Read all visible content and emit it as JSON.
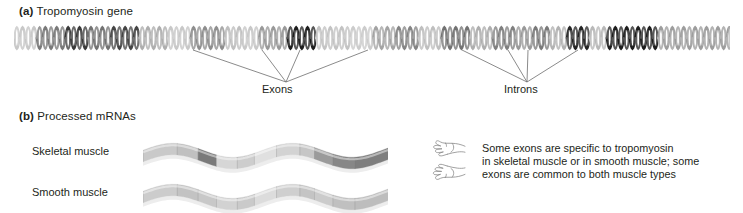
{
  "figure": {
    "panels": [
      {
        "tag": "(a)",
        "title": "Tropomyosin gene"
      },
      {
        "tag": "(b)",
        "title": "Processed mRNAs"
      }
    ]
  },
  "gene": {
    "callouts": [
      {
        "label": "Exons",
        "apex_x": 286,
        "apex_y": 82,
        "leader_x": [
          193,
          262,
          300,
          368
        ]
      },
      {
        "label": "Introns",
        "apex_x": 527,
        "apex_y": 82,
        "leader_x": [
          462,
          508,
          528,
          578
        ]
      }
    ],
    "helix": {
      "x": 14,
      "y": 25,
      "width": 716,
      "height": 26,
      "turn_width": 11.4,
      "strand_colors": [
        "#6f6f6f",
        "#b9b9b9"
      ],
      "segments": [
        {
          "start": 0.0,
          "end": 0.035,
          "shade": 0.18,
          "kind": "intron"
        },
        {
          "start": 0.035,
          "end": 0.075,
          "shade": 0.55,
          "kind": "intron"
        },
        {
          "start": 0.075,
          "end": 0.105,
          "shade": 0.85,
          "kind": "exon"
        },
        {
          "start": 0.105,
          "end": 0.135,
          "shade": 0.58,
          "kind": "intron"
        },
        {
          "start": 0.135,
          "end": 0.175,
          "shade": 0.8,
          "kind": "exon"
        },
        {
          "start": 0.175,
          "end": 0.215,
          "shade": 0.3,
          "kind": "intron"
        },
        {
          "start": 0.215,
          "end": 0.245,
          "shade": 0.18,
          "kind": "intron"
        },
        {
          "start": 0.245,
          "end": 0.295,
          "shade": 0.45,
          "kind": "intron"
        },
        {
          "start": 0.295,
          "end": 0.32,
          "shade": 0.22,
          "kind": "intron"
        },
        {
          "start": 0.32,
          "end": 0.345,
          "shade": 0.18,
          "kind": "intron"
        },
        {
          "start": 0.345,
          "end": 0.385,
          "shade": 0.4,
          "kind": "intron"
        },
        {
          "start": 0.385,
          "end": 0.42,
          "shade": 0.98,
          "kind": "exon"
        },
        {
          "start": 0.42,
          "end": 0.47,
          "shade": 0.2,
          "kind": "intron"
        },
        {
          "start": 0.47,
          "end": 0.5,
          "shade": 0.16,
          "kind": "intron"
        },
        {
          "start": 0.5,
          "end": 0.53,
          "shade": 0.35,
          "kind": "intron"
        },
        {
          "start": 0.53,
          "end": 0.565,
          "shade": 0.5,
          "kind": "intron"
        },
        {
          "start": 0.565,
          "end": 0.6,
          "shade": 0.22,
          "kind": "intron"
        },
        {
          "start": 0.6,
          "end": 0.635,
          "shade": 0.58,
          "kind": "intron"
        },
        {
          "start": 0.635,
          "end": 0.665,
          "shade": 0.3,
          "kind": "intron"
        },
        {
          "start": 0.665,
          "end": 0.7,
          "shade": 0.52,
          "kind": "intron"
        },
        {
          "start": 0.7,
          "end": 0.725,
          "shade": 0.4,
          "kind": "intron"
        },
        {
          "start": 0.725,
          "end": 0.745,
          "shade": 0.55,
          "kind": "intron"
        },
        {
          "start": 0.745,
          "end": 0.775,
          "shade": 0.28,
          "kind": "intron"
        },
        {
          "start": 0.775,
          "end": 0.805,
          "shade": 0.95,
          "kind": "exon"
        },
        {
          "start": 0.805,
          "end": 0.83,
          "shade": 0.25,
          "kind": "intron"
        },
        {
          "start": 0.83,
          "end": 0.9,
          "shade": 0.98,
          "kind": "exon"
        },
        {
          "start": 0.9,
          "end": 1.0,
          "shade": 0.38,
          "kind": "intron"
        }
      ]
    }
  },
  "mrnas": {
    "rows": [
      {
        "label": "Skeletal muscle",
        "name": "skeletal-muscle",
        "width": 245,
        "height": 26,
        "segments": [
          {
            "start": 0.0,
            "end": 0.14,
            "color": "#c9c9c9"
          },
          {
            "start": 0.14,
            "end": 0.225,
            "color": "#c0c0c0"
          },
          {
            "start": 0.225,
            "end": 0.3,
            "color": "#7a7a7a"
          },
          {
            "start": 0.3,
            "end": 0.385,
            "color": "#d6d6d6"
          },
          {
            "start": 0.385,
            "end": 0.455,
            "color": "#cdcdcd"
          },
          {
            "start": 0.455,
            "end": 0.545,
            "color": "#e0e0e0"
          },
          {
            "start": 0.545,
            "end": 0.64,
            "color": "#d3d3d3"
          },
          {
            "start": 0.64,
            "end": 0.7,
            "color": "#c6c6c6"
          },
          {
            "start": 0.7,
            "end": 0.775,
            "color": "#9b9b9b"
          },
          {
            "start": 0.775,
            "end": 0.865,
            "color": "#878787"
          },
          {
            "start": 0.865,
            "end": 1.0,
            "color": "#7e7e7e"
          }
        ]
      },
      {
        "label": "Smooth muscle",
        "name": "smooth-muscle",
        "width": 245,
        "height": 26,
        "segments": [
          {
            "start": 0.0,
            "end": 0.14,
            "color": "#cccccc"
          },
          {
            "start": 0.14,
            "end": 0.225,
            "color": "#c3c3c3"
          },
          {
            "start": 0.225,
            "end": 0.3,
            "color": "#c8c8c8"
          },
          {
            "start": 0.3,
            "end": 0.385,
            "color": "#d2d2d2"
          },
          {
            "start": 0.385,
            "end": 0.455,
            "color": "#cacaca"
          },
          {
            "start": 0.455,
            "end": 0.545,
            "color": "#dcdcdc"
          },
          {
            "start": 0.545,
            "end": 0.64,
            "color": "#cfcfcf"
          },
          {
            "start": 0.64,
            "end": 0.7,
            "color": "#c4c4c4"
          },
          {
            "start": 0.7,
            "end": 0.775,
            "color": "#cbcbcb"
          },
          {
            "start": 0.775,
            "end": 0.865,
            "color": "#c0c0c0"
          },
          {
            "start": 0.865,
            "end": 1.0,
            "color": "#bdbdbd"
          }
        ]
      }
    ]
  },
  "annotation": {
    "icons": [
      "pointing-hand-icon",
      "pointing-hand-icon"
    ],
    "lines": [
      "Some exons are specific to tropomyosin",
      "in skeletal muscle or in smooth muscle; some",
      "exons are common to both muscle types"
    ]
  },
  "colors": {
    "text": "#231f20",
    "leader_line": "#6d6d6d",
    "background": "#ffffff"
  }
}
